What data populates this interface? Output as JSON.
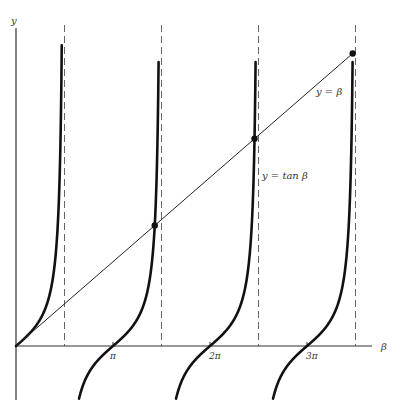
{
  "chart_data": {
    "type": "line",
    "title": "",
    "xlabel": "β",
    "ylabel": "y",
    "xlim": [
      0,
      11.2
    ],
    "ylim": [
      -2.0,
      11.3
    ],
    "grid": false,
    "x_ticks": [
      {
        "value": 3.14159,
        "label": "π"
      },
      {
        "value": 6.28319,
        "label": "2π"
      },
      {
        "value": 9.42478,
        "label": "3π"
      }
    ],
    "asymptotes": [
      1.5708,
      4.7124,
      7.854,
      10.9956
    ],
    "series": [
      {
        "name": "y = tan β",
        "kind": "tan",
        "style": "thick"
      },
      {
        "name": "y = β",
        "kind": "identity",
        "style": "thin"
      }
    ],
    "intersections": [
      {
        "x": 0,
        "y": 0
      },
      {
        "x": 4.4934,
        "y": 4.4934
      },
      {
        "x": 7.7253,
        "y": 7.7253
      },
      {
        "x": 10.9041,
        "y": 10.9041
      }
    ],
    "annotations": [
      {
        "text": "y = β",
        "x": 10.2,
        "y": 9.4
      },
      {
        "text": "y = tan β",
        "x": 7.95,
        "y": 5.6
      }
    ]
  },
  "labels": {
    "y_axis": "y",
    "x_axis": "β",
    "line_label": "y = β",
    "tan_label": "y = tan β",
    "tick_pi": "π",
    "tick_2pi": "2π",
    "tick_3pi": "3π"
  }
}
